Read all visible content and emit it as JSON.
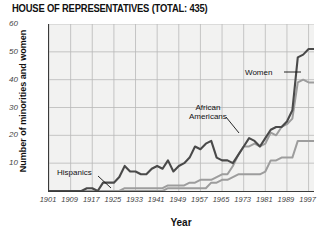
{
  "chart_data": {
    "type": "line",
    "title": "HOUSE OF REPRESENTATIVES (TOTAL: 435)",
    "xlabel": "Year",
    "ylabel": "Number of minorities and women",
    "xlim": [
      1901,
      1999
    ],
    "ylim": [
      0,
      60
    ],
    "yticks": [
      10,
      20,
      30,
      40,
      50,
      60
    ],
    "xticks": [
      1901,
      1909,
      1917,
      1925,
      1933,
      1941,
      1949,
      1957,
      1965,
      1973,
      1981,
      1989,
      1997
    ],
    "grid": true,
    "legend": "annotations",
    "annotations": [
      {
        "text": "Women",
        "series": "Women",
        "x": 1981,
        "y": 44
      },
      {
        "text": "African\nAmericans",
        "series": "African Americans",
        "x": 1963,
        "y": 28
      },
      {
        "text": "Hispanics",
        "series": "Hispanics",
        "x": 1917,
        "y": 8
      }
    ],
    "x": [
      1901,
      1903,
      1905,
      1907,
      1909,
      1911,
      1913,
      1915,
      1917,
      1919,
      1921,
      1923,
      1925,
      1927,
      1929,
      1931,
      1933,
      1935,
      1937,
      1939,
      1941,
      1943,
      1945,
      1947,
      1949,
      1951,
      1953,
      1955,
      1957,
      1959,
      1961,
      1963,
      1965,
      1967,
      1969,
      1971,
      1973,
      1975,
      1977,
      1979,
      1981,
      1983,
      1985,
      1987,
      1989,
      1991,
      1993,
      1995,
      1997,
      1999
    ],
    "series": [
      {
        "name": "Women",
        "color": "#4a4a4a",
        "values": [
          0,
          0,
          0,
          0,
          0,
          0,
          0,
          1,
          1,
          0,
          3,
          3,
          3,
          5,
          9,
          7,
          7,
          6,
          6,
          8,
          9,
          8,
          11,
          7,
          9,
          10,
          12,
          16,
          15,
          17,
          18,
          12,
          11,
          11,
          10,
          13,
          16,
          19,
          18,
          16,
          19,
          22,
          23,
          23,
          25,
          29,
          48,
          49,
          51,
          51
        ]
      },
      {
        "name": "African Americans",
        "color": "#9d9d9d",
        "values": [
          0,
          0,
          0,
          0,
          0,
          0,
          0,
          0,
          0,
          0,
          0,
          0,
          0,
          0,
          1,
          1,
          1,
          1,
          1,
          1,
          1,
          1,
          2,
          2,
          2,
          2,
          3,
          3,
          4,
          4,
          4,
          5,
          6,
          6,
          9,
          13,
          16,
          16,
          17,
          16,
          17,
          21,
          20,
          23,
          24,
          26,
          39,
          40,
          39,
          39
        ]
      },
      {
        "name": "Hispanics",
        "color": "#9d9d9d",
        "values": [
          0,
          0,
          0,
          0,
          0,
          0,
          0,
          0,
          0,
          0,
          0,
          0,
          0,
          0,
          0,
          0,
          0,
          0,
          0,
          0,
          0,
          0,
          1,
          1,
          1,
          1,
          1,
          1,
          1,
          1,
          3,
          3,
          4,
          4,
          5,
          6,
          6,
          6,
          6,
          6,
          7,
          11,
          11,
          12,
          12,
          12,
          18,
          18,
          18,
          18
        ]
      }
    ]
  }
}
